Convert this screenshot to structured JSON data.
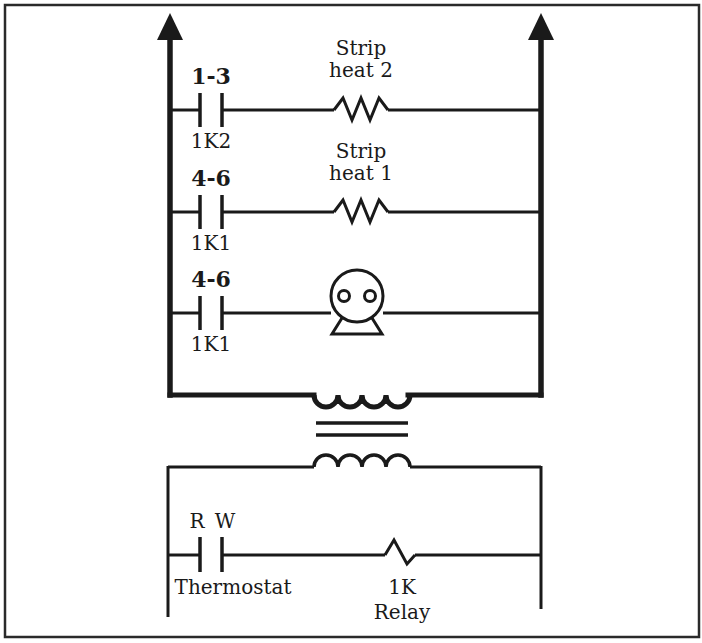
{
  "diagram": {
    "type": "ladder-schematic",
    "colors": {
      "line": "#1a1a1a",
      "background": "#ffffff",
      "frame": "#2a2a2a"
    },
    "power_circuit": {
      "rungs": [
        {
          "contact": {
            "top_label": "1-3",
            "bottom_label": "1K2"
          },
          "load": {
            "kind": "resistor",
            "label_line1": "Strip",
            "label_line2": "heat 2"
          }
        },
        {
          "contact": {
            "top_label": "4-6",
            "bottom_label": "1K1"
          },
          "load": {
            "kind": "resistor",
            "label_line1": "Strip",
            "label_line2": "heat 1"
          }
        },
        {
          "contact": {
            "top_label": "4-6",
            "bottom_label": "1K1"
          },
          "load": {
            "kind": "motor"
          }
        }
      ]
    },
    "transformer": {
      "primary": "coil",
      "core": "double-line",
      "secondary": "coil"
    },
    "control_circuit": {
      "contact": {
        "top_left_label": "R",
        "top_right_label": "W",
        "bottom_label": "Thermostat"
      },
      "load": {
        "kind": "relay-coil",
        "label_line1": "1K",
        "label_line2": "Relay"
      }
    }
  }
}
